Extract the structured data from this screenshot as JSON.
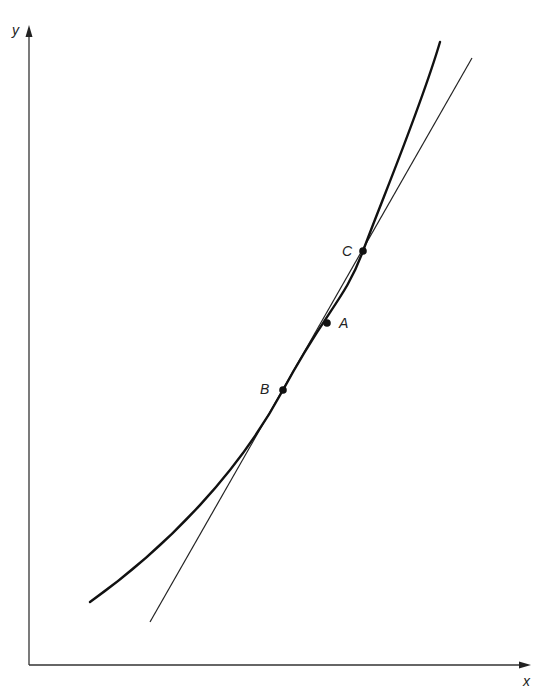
{
  "diagram": {
    "axes": {
      "x_label": "x",
      "y_label": "y"
    },
    "points": [
      {
        "id": "B",
        "label": "B",
        "x": 283,
        "y": 390
      },
      {
        "id": "A",
        "label": "A",
        "x": 327,
        "y": 323
      },
      {
        "id": "C",
        "label": "C",
        "x": 363,
        "y": 251
      }
    ],
    "curve": {
      "description": "convex increasing curve",
      "start": [
        90,
        602
      ],
      "end": [
        440,
        42
      ]
    },
    "line": {
      "description": "straight line (chord BC extended)",
      "start": [
        150,
        622
      ],
      "end": [
        472,
        58
      ]
    },
    "colors": {
      "ink": "#1a1a1a",
      "background": "#ffffff"
    }
  }
}
